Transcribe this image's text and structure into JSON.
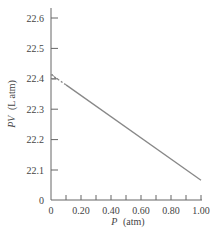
{
  "chart_data": {
    "type": "line",
    "title": "",
    "xlabel": "P (atm)",
    "xlabel_var": "P",
    "xlabel_unit": "(atm)",
    "ylabel": "PV (L atm)",
    "ylabel_var": "PV",
    "ylabel_unit": "(L atm)",
    "xlim": [
      0,
      1.0
    ],
    "ylim_display": [
      22.0,
      22.6
    ],
    "y_axis_break": true,
    "x_ticks": [
      "0",
      "0.20",
      "0.40",
      "0.60",
      "0.80",
      "1.00"
    ],
    "x_tick_values": [
      0,
      0.2,
      0.4,
      0.6,
      0.8,
      1.0
    ],
    "x_minor_ticks": [
      0.1,
      0.3,
      0.5,
      0.7,
      0.9
    ],
    "y_ticks": [
      "22.6",
      "22.5",
      "22.4",
      "22.3",
      "22.2",
      "22.1",
      "0"
    ],
    "y_tick_values": [
      22.6,
      22.5,
      22.4,
      22.3,
      22.2,
      22.1,
      0
    ],
    "grid": false,
    "legend": null,
    "series": [
      {
        "name": "extrapolated",
        "style": "dashed",
        "x": [
          0.0,
          0.1
        ],
        "y": [
          22.414,
          22.38
        ]
      },
      {
        "name": "measured",
        "style": "solid",
        "x": [
          0.1,
          1.0
        ],
        "y": [
          22.38,
          22.066
        ]
      }
    ],
    "annotations": [
      {
        "type": "intercept",
        "x": 0,
        "y": 22.414
      }
    ]
  }
}
